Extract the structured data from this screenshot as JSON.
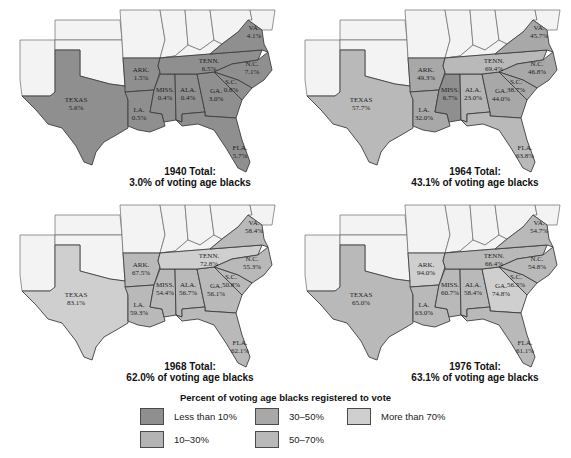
{
  "figure": {
    "legend_title": "Percent of voting age blacks registered to vote",
    "categories": [
      {
        "key": "lt10",
        "label": "Less than 10%",
        "color": "#8f8f8f"
      },
      {
        "key": "10_30",
        "label": "10–30%",
        "color": "#b4b4b4"
      },
      {
        "key": "30_50",
        "label": "30–50%",
        "color": "#a8a8a8"
      },
      {
        "key": "50_70",
        "label": "50–70%",
        "color": "#b9b9b9"
      },
      {
        "key": "gt70",
        "label": "More than 70%",
        "color": "#cfcfcf"
      }
    ]
  },
  "maps": [
    {
      "year": "1940",
      "total_line1": "1940 Total:",
      "total_line2": "3.0% of voting age blacks",
      "states": {
        "TX": {
          "name": "TEXAS",
          "value": "5.6%"
        },
        "AR": {
          "name": "ARK.",
          "value": "1.5%"
        },
        "LA": {
          "name": "LA.",
          "value": "0.5%"
        },
        "MS": {
          "name": "MISS.",
          "value": "0.4%"
        },
        "AL": {
          "name": "ALA.",
          "value": "0.4%"
        },
        "GA": {
          "name": "GA.",
          "value": "3.0%"
        },
        "FL": {
          "name": "FLA.",
          "value": "5.7%"
        },
        "TN": {
          "name": "TENN.",
          "value": "6.5%"
        },
        "NC": {
          "name": "N.C.",
          "value": "7.1%"
        },
        "SC": {
          "name": "S.C.",
          "value": "0.8%"
        },
        "VA": {
          "name": "VA.",
          "value": "4.1%"
        }
      }
    },
    {
      "year": "1964",
      "total_line1": "1964 Total:",
      "total_line2": "43.1% of voting age blacks",
      "states": {
        "TX": {
          "name": "TEXAS",
          "value": "57.7%"
        },
        "AR": {
          "name": "ARK.",
          "value": "49.3%"
        },
        "LA": {
          "name": "LA.",
          "value": "32.0%"
        },
        "MS": {
          "name": "MISS.",
          "value": "6.7%"
        },
        "AL": {
          "name": "ALA.",
          "value": "23.0%"
        },
        "GA": {
          "name": "GA.",
          "value": "44.0%"
        },
        "FL": {
          "name": "FLA.",
          "value": "63.8%"
        },
        "TN": {
          "name": "TENN.",
          "value": "69.4%"
        },
        "NC": {
          "name": "N.C.",
          "value": "46.8%"
        },
        "SC": {
          "name": "S.C.",
          "value": "38.7%"
        },
        "VA": {
          "name": "VA.",
          "value": "45.7%"
        }
      }
    },
    {
      "year": "1968",
      "total_line1": "1968 Total:",
      "total_line2": "62.0% of voting age blacks",
      "states": {
        "TX": {
          "name": "TEXAS",
          "value": "83.1%"
        },
        "AR": {
          "name": "ARK.",
          "value": "67.5%"
        },
        "LA": {
          "name": "LA.",
          "value": "59.3%"
        },
        "MS": {
          "name": "MISS.",
          "value": "54.4%"
        },
        "AL": {
          "name": "ALA.",
          "value": "56.7%"
        },
        "GA": {
          "name": "GA.",
          "value": "56.1%"
        },
        "FL": {
          "name": "FLA.",
          "value": "62.1%"
        },
        "TN": {
          "name": "TENN.",
          "value": "72.8%"
        },
        "NC": {
          "name": "N.C.",
          "value": "55.3%"
        },
        "SC": {
          "name": "S.C.",
          "value": "50.8%"
        },
        "VA": {
          "name": "VA.",
          "value": "58.4%"
        }
      }
    },
    {
      "year": "1976",
      "total_line1": "1976 Total:",
      "total_line2": "63.1% of voting age blacks",
      "states": {
        "TX": {
          "name": "TEXAS",
          "value": "65.0%"
        },
        "AR": {
          "name": "ARK.",
          "value": "94.0%"
        },
        "LA": {
          "name": "LA.",
          "value": "63.0%"
        },
        "MS": {
          "name": "MISS.",
          "value": "60.7%"
        },
        "AL": {
          "name": "ALA.",
          "value": "58.4%"
        },
        "GA": {
          "name": "GA.",
          "value": "74.8%"
        },
        "FL": {
          "name": "FLA.",
          "value": "61.1%"
        },
        "TN": {
          "name": "TENN.",
          "value": "66.4%"
        },
        "NC": {
          "name": "N.C.",
          "value": "54.8%"
        },
        "SC": {
          "name": "S.C.",
          "value": "56.5%"
        },
        "VA": {
          "name": "VA.",
          "value": "54.7%"
        }
      }
    }
  ]
}
